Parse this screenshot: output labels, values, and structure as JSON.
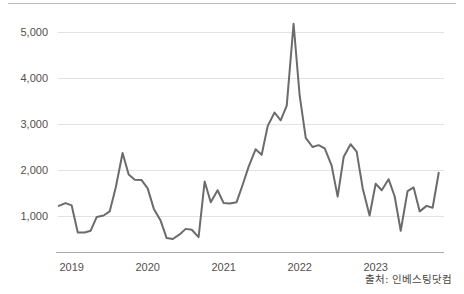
{
  "source_note": "출처: 인베스팅닷컴",
  "chart_data": {
    "type": "line",
    "title": "",
    "subtitle": "",
    "xlabel": "",
    "ylabel": "",
    "grid": true,
    "legend": false,
    "legend_position": "none",
    "line_color": "#6b6b6b",
    "gridline_color": "#e3e3e3",
    "axis_color": "#a8a8a8",
    "background_color": "#ffffff",
    "ylim": [
      0,
      5600
    ],
    "yticks": [
      1000,
      2000,
      3000,
      4000,
      5000
    ],
    "ytick_labels": [
      "1,000",
      "2,000",
      "3,000",
      "4,000",
      "5,000"
    ],
    "xticks": [
      2019,
      2020,
      2021,
      2022,
      2023
    ],
    "xtick_labels": [
      "2019",
      "2020",
      "2021",
      "2022",
      "2023"
    ],
    "xlim": [
      2018.82,
      2023.86
    ],
    "x": [
      2018.83,
      2018.92,
      2019.0,
      2019.08,
      2019.17,
      2019.25,
      2019.33,
      2019.42,
      2019.5,
      2019.58,
      2019.67,
      2019.75,
      2019.83,
      2019.92,
      2020.0,
      2020.08,
      2020.17,
      2020.25,
      2020.33,
      2020.42,
      2020.5,
      2020.58,
      2020.67,
      2020.75,
      2020.83,
      2020.92,
      2021.0,
      2021.08,
      2021.17,
      2021.25,
      2021.33,
      2021.42,
      2021.5,
      2021.58,
      2021.67,
      2021.75,
      2021.83,
      2021.92,
      2022.0,
      2022.08,
      2022.17,
      2022.25,
      2022.33,
      2022.42,
      2022.5,
      2022.58,
      2022.67,
      2022.75,
      2022.83,
      2022.92,
      2023.0,
      2023.08,
      2023.17,
      2023.25,
      2023.33,
      2023.42,
      2023.5,
      2023.58,
      2023.67,
      2023.75,
      2023.83
    ],
    "values": [
      1220,
      1280,
      1230,
      640,
      640,
      680,
      980,
      1010,
      1100,
      1620,
      2370,
      1900,
      1790,
      1780,
      1600,
      1160,
      900,
      520,
      500,
      600,
      720,
      700,
      540,
      1750,
      1300,
      1560,
      1280,
      1270,
      1300,
      1680,
      2080,
      2450,
      2330,
      2960,
      3250,
      3080,
      3400,
      5180,
      3620,
      2700,
      2500,
      2540,
      2470,
      2100,
      1420,
      2290,
      2560,
      2400,
      1600,
      1010,
      1700,
      1560,
      1800,
      1430,
      680,
      1540,
      1620,
      1100,
      1220,
      1180,
      1940
    ],
    "series_name": "지수"
  }
}
